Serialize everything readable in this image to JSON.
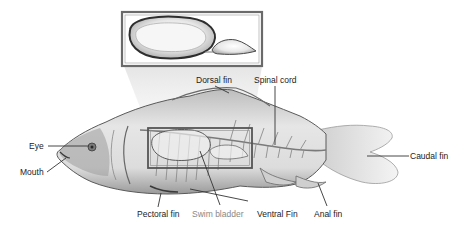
{
  "diagram": {
    "inset": {
      "subject": "swim-bladder-magnified",
      "frame_color": "#6a6a6a"
    },
    "highlight_box_color": "#555555",
    "colors": {
      "background": "#ffffff",
      "body_fill": "#d9d9d9",
      "body_stroke": "#5a5a5a",
      "leader_line": "#333333",
      "label_text": "#222222",
      "muted_label_text": "#888888"
    },
    "labels": [
      {
        "id": "dorsal-fin",
        "text": "Dorsal fin"
      },
      {
        "id": "spinal-cord",
        "text": "Spinal cord"
      },
      {
        "id": "eye",
        "text": "Eye"
      },
      {
        "id": "mouth",
        "text": "Mouth"
      },
      {
        "id": "caudal-fin",
        "text": "Caudal fin"
      },
      {
        "id": "pectoral-fin",
        "text": "Pectoral fin"
      },
      {
        "id": "swim-bladder",
        "text": "Swim bladder"
      },
      {
        "id": "ventral-fin",
        "text": "Ventral Fin"
      },
      {
        "id": "anal-fin",
        "text": "Anal fin"
      }
    ]
  }
}
